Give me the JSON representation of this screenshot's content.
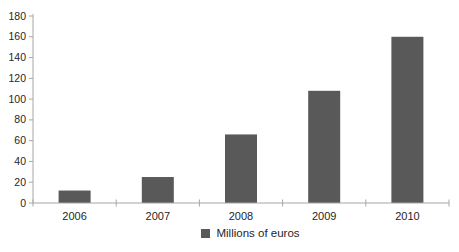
{
  "chart_data": {
    "type": "bar",
    "categories": [
      "2006",
      "2007",
      "2008",
      "2009",
      "2010"
    ],
    "values": [
      12,
      25,
      66,
      108,
      160
    ],
    "title": "",
    "xlabel": "",
    "ylabel": "",
    "ylim": [
      0,
      180
    ],
    "y_ticks": [
      0,
      20,
      40,
      60,
      80,
      100,
      120,
      140,
      160,
      180
    ],
    "grid": false,
    "legend": "Millions of euros",
    "legend_position": "bottom-center",
    "bar_color": "#595959",
    "axis_color": "#a6a6a6",
    "text_color": "#262626"
  }
}
